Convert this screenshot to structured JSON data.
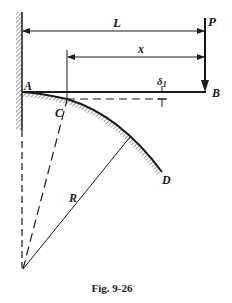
{
  "figure": {
    "caption": "Fig. 9-26",
    "labels": {
      "L": "L",
      "P": "P",
      "x": "x",
      "A": "A",
      "B": "B",
      "C": "C",
      "D": "D",
      "R": "R",
      "delta": "δ",
      "delta_sub": "1"
    }
  },
  "colors": {
    "ink": "#1a1a1a",
    "background": "#ffffff"
  }
}
